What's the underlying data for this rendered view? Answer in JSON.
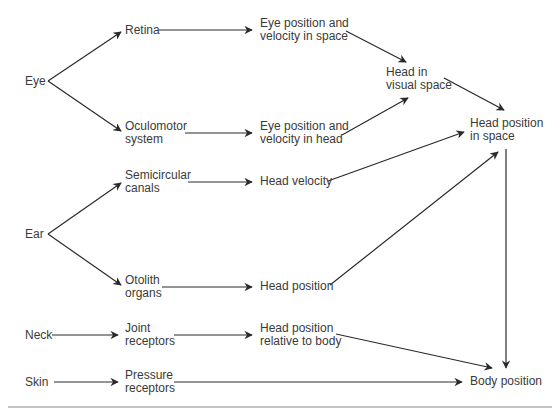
{
  "diagram": {
    "nodes": {
      "eye": "Eye",
      "retina": "Retina",
      "oculomotor": "Oculomotor\nsystem",
      "eye_space": "Eye position and\nvelocity in space",
      "eye_head": "Eye position and\nvelocity in head",
      "head_visual": "Head in\nvisual space",
      "head_pos_space": "Head position\nin space",
      "ear": "Ear",
      "semicircular": "Semicircular\ncanals",
      "head_velocity": "Head velocity",
      "otolith": "Otolith\norgans",
      "head_position": "Head position",
      "neck": "Neck",
      "joint": "Joint\nreceptors",
      "head_rel_body": "Head position\nrelative to body",
      "skin": "Skin",
      "pressure": "Pressure\nreceptors",
      "body_position": "Body position"
    },
    "edges": [
      [
        "Eye",
        "Retina"
      ],
      [
        "Eye",
        "Oculomotor system"
      ],
      [
        "Retina",
        "Eye position and velocity in space"
      ],
      [
        "Oculomotor system",
        "Eye position and velocity in head"
      ],
      [
        "Eye position and velocity in space",
        "Head in visual space"
      ],
      [
        "Eye position and velocity in head",
        "Head in visual space"
      ],
      [
        "Head in visual space",
        "Head position in space"
      ],
      [
        "Ear",
        "Semicircular canals"
      ],
      [
        "Ear",
        "Otolith organs"
      ],
      [
        "Semicircular canals",
        "Head velocity"
      ],
      [
        "Head velocity",
        "Head position in space"
      ],
      [
        "Otolith organs",
        "Head position"
      ],
      [
        "Head position",
        "Head position in space"
      ],
      [
        "Neck",
        "Joint receptors"
      ],
      [
        "Joint receptors",
        "Head position relative to body"
      ],
      [
        "Head position relative to body",
        "Body position"
      ],
      [
        "Skin",
        "Pressure receptors"
      ],
      [
        "Pressure receptors",
        "Body position"
      ],
      [
        "Head position in space",
        "Body position"
      ]
    ]
  }
}
